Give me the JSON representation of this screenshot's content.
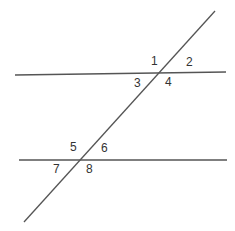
{
  "diagram": {
    "line_color": "#555555",
    "label_color": "#333333",
    "lines": [
      {
        "name": "top-parallel-line",
        "x1": 15,
        "y1": 75,
        "x2": 226,
        "y2": 72
      },
      {
        "name": "bottom-parallel-line",
        "x1": 19,
        "y1": 160,
        "x2": 227,
        "y2": 160
      },
      {
        "name": "transversal-line",
        "x1": 24,
        "y1": 222,
        "x2": 215,
        "y2": 11
      }
    ],
    "angle_labels": [
      {
        "text": "1",
        "x": 151,
        "y": 55
      },
      {
        "text": "2",
        "x": 186,
        "y": 56
      },
      {
        "text": "3",
        "x": 134,
        "y": 77
      },
      {
        "text": "4",
        "x": 165,
        "y": 76
      },
      {
        "text": "5",
        "x": 70,
        "y": 141
      },
      {
        "text": "6",
        "x": 101,
        "y": 142
      },
      {
        "text": "7",
        "x": 53,
        "y": 163
      },
      {
        "text": "8",
        "x": 86,
        "y": 163
      }
    ]
  }
}
